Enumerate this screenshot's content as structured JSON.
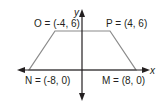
{
  "diagram": {
    "type": "coordinate-plane-trapezoid",
    "axes": {
      "x_label": "x",
      "y_label": "y"
    },
    "colors": {
      "axis": "#231f20",
      "shape": "#8a8a8a",
      "text": "#231f20"
    },
    "vertices": [
      {
        "name": "O",
        "coords": "(-4, 6)",
        "text": "O = (-4, 6)"
      },
      {
        "name": "P",
        "coords": "(4, 6)",
        "text": "P = (4, 6)"
      },
      {
        "name": "M",
        "coords": "(8, 0)",
        "text": "M = (8, 0)"
      },
      {
        "name": "N",
        "coords": "(-8, 0)",
        "text": "N = (-8, 0)"
      }
    ]
  }
}
